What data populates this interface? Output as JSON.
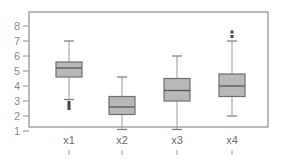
{
  "chart_data": {
    "type": "boxplot",
    "title": "",
    "xlabel": "",
    "ylabel": "",
    "ylim": [
      1,
      8.8
    ],
    "yticks": [
      1,
      2,
      3,
      4,
      5,
      6,
      7,
      8
    ],
    "ytick_labels": [
      "1",
      "2",
      "3",
      "4",
      "5",
      "6",
      "7",
      "8"
    ],
    "grid": false,
    "legend": "none",
    "categories": [
      "x1",
      "x2",
      "x3",
      "x4"
    ],
    "series": [
      {
        "name": "x1",
        "whisker_low": 3.1,
        "q1": 4.6,
        "median": 5.2,
        "q3": 5.6,
        "whisker_high": 7.0,
        "outliers": [
          2.9,
          2.7,
          2.5
        ]
      },
      {
        "name": "x2",
        "whisker_low": 1.1,
        "q1": 2.1,
        "median": 2.6,
        "q3": 3.3,
        "whisker_high": 4.6,
        "outliers": []
      },
      {
        "name": "x3",
        "whisker_low": 1.1,
        "q1": 3.0,
        "median": 3.7,
        "q3": 4.5,
        "whisker_high": 6.0,
        "outliers": []
      },
      {
        "name": "x4",
        "whisker_low": 2.0,
        "q1": 3.3,
        "median": 4.0,
        "q3": 4.8,
        "whisker_high": 7.0,
        "outliers": [
          7.3,
          7.6
        ]
      }
    ],
    "colors": {
      "box_fill": "#b8b8b8",
      "box_stroke": "#6e6e6e",
      "median": "#555555",
      "whisker": "#9a9a9a",
      "frame": "#8c8c8c",
      "outlier": "#444444"
    }
  }
}
